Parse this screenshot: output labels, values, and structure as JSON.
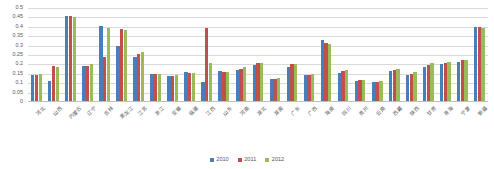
{
  "chart_data": {
    "type": "bar",
    "title": "",
    "xlabel": "",
    "ylabel": "",
    "ylim": [
      0,
      0.5
    ],
    "y_ticks": [
      "0",
      "0.05",
      "0.1",
      "0.15",
      "0.2",
      "0.25",
      "0.3",
      "0.35",
      "0.4",
      "0.45",
      "0.5"
    ],
    "grid": true,
    "legend_position": "bottom",
    "categories": [
      "河北",
      "山西",
      "内蒙古",
      "辽宁",
      "吉林",
      "黑龙江",
      "江苏",
      "浙江",
      "安徽",
      "福建",
      "江西",
      "山东",
      "河南",
      "湖北",
      "湖南",
      "广东",
      "广西",
      "海南",
      "四川",
      "贵州",
      "云南",
      "西藏",
      "陕西",
      "甘肃",
      "青海",
      "宁夏",
      "新疆"
    ],
    "series": [
      {
        "name": "2010",
        "color": "#4a7ebb",
        "values": [
          0.142,
          0.113,
          0.46,
          0.194,
          0.403,
          0.296,
          0.24,
          0.151,
          0.139,
          0.158,
          0.104,
          0.163,
          0.169,
          0.197,
          0.123,
          0.188,
          0.144,
          0.33,
          0.155,
          0.113,
          0.108,
          0.166,
          0.144,
          0.185,
          0.2,
          0.211,
          0.398
        ]
      },
      {
        "name": "2011",
        "color": "#c0504d",
        "values": [
          0.142,
          0.194,
          0.455,
          0.194,
          0.238,
          0.391,
          0.255,
          0.151,
          0.138,
          0.155,
          0.395,
          0.162,
          0.176,
          0.207,
          0.125,
          0.2,
          0.146,
          0.315,
          0.167,
          0.115,
          0.107,
          0.168,
          0.148,
          0.196,
          0.21,
          0.223,
          0.4
        ]
      },
      {
        "name": "2012",
        "color": "#9bbb59",
        "values": [
          0.148,
          0.187,
          0.453,
          0.201,
          0.392,
          0.382,
          0.268,
          0.151,
          0.146,
          0.153,
          0.205,
          0.161,
          0.184,
          0.21,
          0.13,
          0.203,
          0.148,
          0.309,
          0.172,
          0.119,
          0.112,
          0.176,
          0.158,
          0.205,
          0.213,
          0.226,
          0.394
        ]
      }
    ]
  },
  "legend": {
    "items": [
      {
        "label": "2010"
      },
      {
        "label": "2011"
      },
      {
        "label": "2012"
      }
    ]
  }
}
